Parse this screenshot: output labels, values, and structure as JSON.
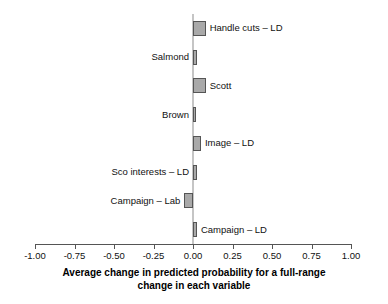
{
  "chart_data": {
    "type": "bar",
    "orientation": "horizontal",
    "title": "",
    "xlabel_line1": "Average change in predicted probability for a full-range",
    "xlabel_line2": "change in each variable",
    "ylabel": "",
    "xlim": [
      -1.0,
      1.0
    ],
    "grid": false,
    "legend": "none",
    "tick_labels": [
      "-1.00",
      "-0.75",
      "-0.50",
      "-0.25",
      "0.00",
      "0.25",
      "0.50",
      "0.75",
      "1.00"
    ],
    "tick_values": [
      -1.0,
      -0.75,
      -0.5,
      -0.25,
      0.0,
      0.25,
      0.5,
      0.75,
      1.0
    ],
    "categories": [
      "Handle cuts – LD",
      "Salmond",
      "Scott",
      "Brown",
      "Image – LD",
      "Sco interests – LD",
      "Campaign – Lab",
      "Campaign – LD"
    ],
    "values": [
      0.08,
      0.025,
      0.08,
      0.018,
      0.05,
      0.025,
      -0.055,
      0.025
    ],
    "label_side": [
      "right",
      "left",
      "right",
      "left",
      "right",
      "left",
      "left",
      "right"
    ],
    "bar_color": "#a9a9a9",
    "bar_edge_color": "#555555",
    "zero_line_color": "#8c8c8c",
    "axis_color": "#555555"
  }
}
